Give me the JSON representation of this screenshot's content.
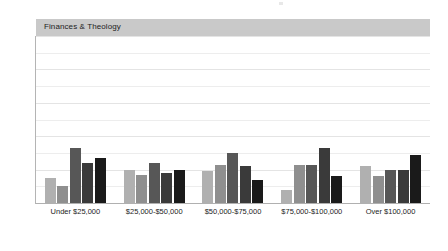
{
  "panel": {
    "header_label": "Finances & Theology"
  },
  "chart_data": {
    "type": "bar",
    "title": "Finances & Theology",
    "xlabel": "",
    "ylabel": "",
    "ylim": [
      0,
      100
    ],
    "ytick_labels": [
      "0%",
      "20%",
      "40%",
      "60%",
      "80%",
      "100%"
    ],
    "ytick_values": [
      0,
      20,
      40,
      60,
      80,
      100
    ],
    "grid": true,
    "grid_minor_step": 10,
    "legend": "none",
    "categories": [
      "Under $25,000",
      "$25,000-$50,000",
      "$50,000-$75,000",
      "$75,000-$100,000",
      "Over $100,000"
    ],
    "series": [
      {
        "name": "Series 1",
        "color": "#b0b0b0",
        "values": [
          15,
          20,
          19,
          8,
          22
        ]
      },
      {
        "name": "Series 2",
        "color": "#8f8f8f",
        "values": [
          10,
          17,
          23,
          23,
          16
        ]
      },
      {
        "name": "Series 3",
        "color": "#575757",
        "values": [
          33,
          24,
          30,
          23,
          20
        ]
      },
      {
        "name": "Series 4",
        "color": "#3a3a3a",
        "values": [
          24,
          18,
          22,
          33,
          20
        ]
      },
      {
        "name": "Series 5",
        "color": "#1a1a1a",
        "values": [
          27,
          20,
          14,
          16,
          29
        ]
      }
    ]
  }
}
